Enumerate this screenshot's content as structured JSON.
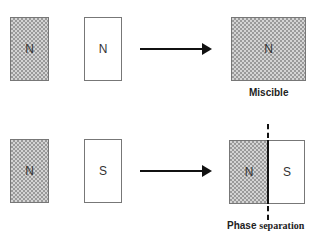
{
  "rows": [
    {
      "name": "miscible-row",
      "left_box": {
        "label": "N",
        "fill": "hatched"
      },
      "middle_box": {
        "label": "N",
        "fill": "white"
      },
      "result": {
        "label": "N",
        "fill": "hatched",
        "caption": "Miscible"
      }
    },
    {
      "name": "phase-separation-row",
      "left_box": {
        "label": "N",
        "fill": "hatched"
      },
      "middle_box": {
        "label": "S",
        "fill": "white"
      },
      "result": {
        "left_label": "N",
        "right_label": "S",
        "caption_bold": "Phase",
        "caption_rest": "separation"
      }
    }
  ],
  "colors": {
    "hatch_dark": "#9a9a9a",
    "hatch_light": "#d4d4d4",
    "border": "#777777",
    "arrow": "#111111"
  }
}
